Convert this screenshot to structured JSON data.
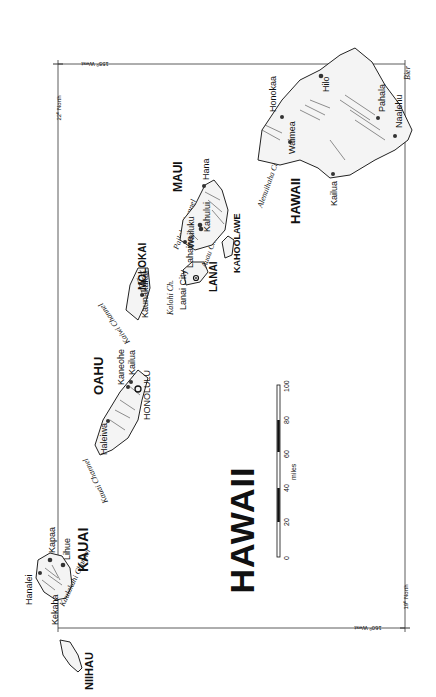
{
  "map": {
    "title": "HAWAII",
    "orientation": "rotated 90 degrees counter-clockwise",
    "signature": "Bier",
    "graticule": {
      "lat_top": "22º North",
      "lat_bottom": "19º North",
      "lon_left": "160º West",
      "lon_right": "155º West"
    },
    "scale_bar": {
      "unit": "miles",
      "ticks": [
        "0",
        "20",
        "40",
        "60",
        "80",
        "100"
      ]
    },
    "islands": [
      {
        "name": "NIIHAU"
      },
      {
        "name": "KAUAI"
      },
      {
        "name": "OAHU"
      },
      {
        "name": "MOLOKAI"
      },
      {
        "name": "LANAI"
      },
      {
        "name": "MAUI"
      },
      {
        "name": "KAHOOLAWE"
      },
      {
        "name": "HAWAII"
      }
    ],
    "towns": {
      "hanalei": "Hanalei",
      "kekaha": "Kekaha",
      "kapaa": "Kapaa",
      "lihue": "Lihue",
      "haleiwa": "Haleiwa",
      "kaneohe": "Kaneohe",
      "kailua_oahu": "Kailua",
      "honolulu": "HONOLULU",
      "kaunakakai": "Kaunakakai",
      "lanai_city": "Lanai City",
      "lahaina": "Lahaina",
      "wailuku": "Wailuku",
      "kahului": "Kahului",
      "hana": "Hana",
      "honokaa": "Honokaa",
      "waimea": "Waimea",
      "hilo": "Hilo",
      "kailua_hawaii": "Kailua",
      "pahala": "Pahala",
      "naalehu": "Naalehu"
    },
    "channels": {
      "kaulakahi": "Kaulakahi Channel",
      "kauai": "Kauai Channel",
      "kaiwi": "Kaiwi Channel",
      "kalohi": "Kalohi Ch.",
      "pailolo": "Pailolo Channel",
      "auau": "Auau Ch.",
      "alenuihaha": "Alenuihaha Channel"
    }
  }
}
